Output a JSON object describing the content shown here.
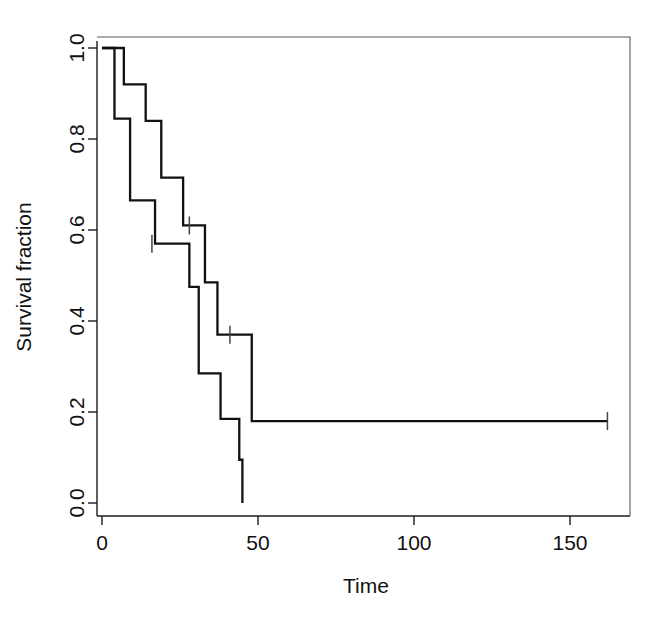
{
  "chart_data": {
    "type": "line",
    "title": "",
    "subtitle": "",
    "xlabel": "Time",
    "ylabel": "Survival fraction",
    "xlim": [
      0,
      172
    ],
    "ylim": [
      0.0,
      1.04
    ],
    "xticks": [
      0,
      50,
      100,
      150
    ],
    "xtick_labels": [
      "0",
      "50",
      "100",
      "150"
    ],
    "yticks": [
      0.0,
      0.2,
      0.4,
      0.6,
      0.8,
      1.0
    ],
    "ytick_labels": [
      "0.0",
      "0.2",
      "0.4",
      "0.6",
      "0.8",
      "1.0"
    ],
    "grid": false,
    "legend": "none",
    "line_color": "#111111",
    "step_style": "post",
    "series": [
      {
        "name": "upper-curve",
        "step_points": [
          [
            0,
            1.0
          ],
          [
            7,
            1.0
          ],
          [
            7,
            0.92
          ],
          [
            14,
            0.92
          ],
          [
            14,
            0.84
          ],
          [
            19,
            0.84
          ],
          [
            19,
            0.715
          ],
          [
            26,
            0.715
          ],
          [
            26,
            0.61
          ],
          [
            33,
            0.61
          ],
          [
            33,
            0.485
          ],
          [
            37,
            0.485
          ],
          [
            37,
            0.37
          ],
          [
            48,
            0.37
          ],
          [
            48,
            0.18
          ],
          [
            162,
            0.18
          ]
        ],
        "censor_times": [
          28,
          41,
          162
        ],
        "censor_values": [
          0.61,
          0.37,
          0.18
        ]
      },
      {
        "name": "lower-curve",
        "step_points": [
          [
            0,
            1.0
          ],
          [
            4,
            1.0
          ],
          [
            4,
            0.845
          ],
          [
            9,
            0.845
          ],
          [
            9,
            0.665
          ],
          [
            17,
            0.665
          ],
          [
            17,
            0.57
          ],
          [
            28,
            0.57
          ],
          [
            28,
            0.475
          ],
          [
            31,
            0.475
          ],
          [
            31,
            0.285
          ],
          [
            38,
            0.285
          ],
          [
            38,
            0.185
          ],
          [
            44,
            0.185
          ],
          [
            44,
            0.095
          ],
          [
            45,
            0.095
          ],
          [
            45,
            0.0
          ]
        ],
        "censor_times": [
          16
        ],
        "censor_values": [
          0.57
        ]
      }
    ]
  },
  "axes": {
    "x_title": "Time",
    "y_title": "Survival fraction"
  },
  "colors": {
    "curve": "#111111",
    "axis": "#1c1c1c",
    "frame": "#5a5a5a",
    "background": "#ffffff"
  }
}
